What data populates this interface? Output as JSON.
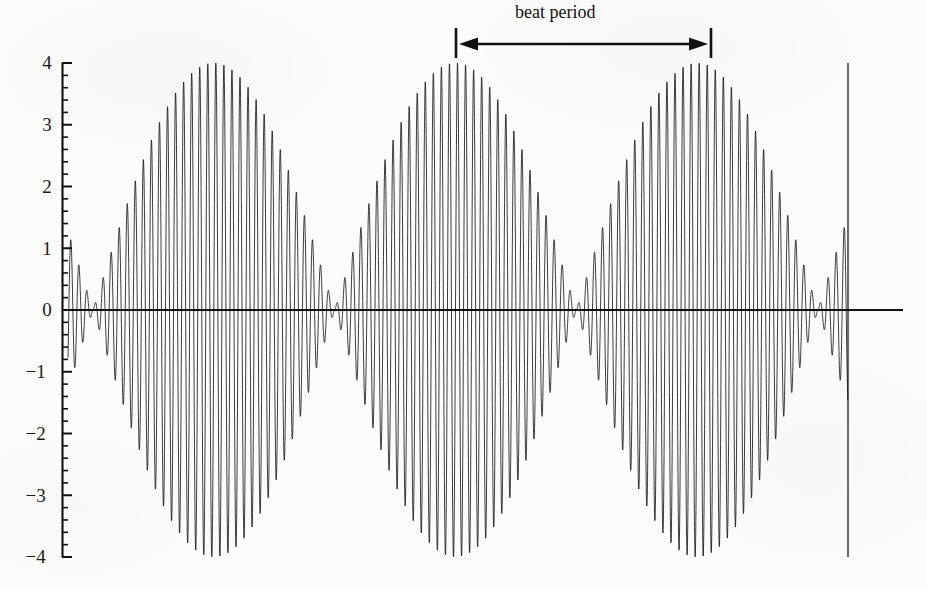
{
  "figure": {
    "title": "",
    "background_color": "#fbfbfa",
    "ink_color": "#111111"
  },
  "annotation": {
    "beat_period_label": "beat period",
    "arrow_icon": "double-headed-arrow-icon",
    "left_marker_x": 455,
    "right_marker_x": 712,
    "arrow_y": 44,
    "label_x": 515,
    "label_y": 2
  },
  "axes": {
    "y_tick_labels": [
      "4",
      "3",
      "2",
      "1",
      "0",
      "−1",
      "−2",
      "−3",
      "−4"
    ],
    "y_tick_values": [
      4,
      3,
      2,
      1,
      0,
      -1,
      -2,
      -3,
      -4
    ],
    "y_minor_per_major": 5,
    "y_axis_x_px": 62,
    "y_top_px": 63,
    "y_bottom_px": 557,
    "zero_line_y_px": 310,
    "zero_line_x_start_px": 62,
    "zero_line_x_end_px": 903,
    "x_axis_visible": false,
    "x_tick_labels": []
  },
  "chart_data": {
    "type": "line",
    "title": "",
    "xlabel": "",
    "ylabel": "",
    "ylim": [
      -4,
      4
    ],
    "xlim": [
      0,
      3.5
    ],
    "grid": false,
    "legend": null,
    "envelope_amplitude": 4,
    "carrier_cycles_per_beat": 30,
    "beat_period_units": 1,
    "node_positions_px": [
      93,
      334,
      577,
      818
    ],
    "wave_start_px": 68,
    "wave_end_px": 848,
    "series": [
      {
        "name": "beat waveform",
        "envelope": {
          "peaks_y": [
            4,
            -4
          ],
          "peak_positions_px": [
            213,
            456,
            698
          ]
        }
      }
    ],
    "annotations": [
      {
        "text": "beat period",
        "from_px": 455,
        "to_px": 712,
        "kind": "double-arrow"
      }
    ]
  }
}
